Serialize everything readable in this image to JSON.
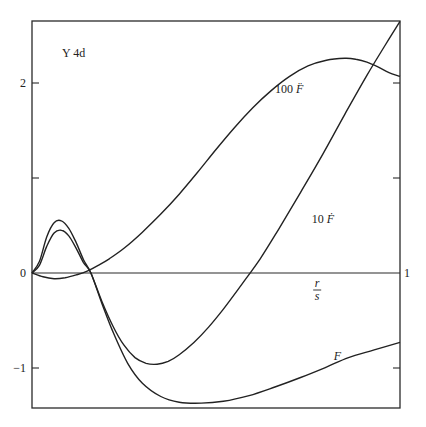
{
  "chart_data": {
    "type": "line",
    "title": "Y 4d",
    "xlabel": "r/s",
    "xlabel_num": "r",
    "xlabel_den": "s",
    "ylabel": "",
    "xlim": [
      0,
      1
    ],
    "ylim": [
      -1.4,
      2.65
    ],
    "x_tick_labels": [
      {
        "value": 1,
        "label": "1"
      }
    ],
    "y_tick_labels": [
      {
        "value": 2,
        "label": "2"
      },
      {
        "value": 0,
        "label": "0"
      },
      {
        "value": -1,
        "label": "-1"
      }
    ],
    "y_ticks_unlabeled": [
      1
    ],
    "right_axis_ticks": [
      2,
      1,
      -1
    ],
    "grid": false,
    "legend": "inline labels",
    "series": [
      {
        "name": "F",
        "label_prefix": "",
        "label_symbol": "F",
        "label_pos": [
          0.82,
          -0.92
        ],
        "x": [
          0,
          0.02,
          0.04,
          0.06,
          0.08,
          0.1,
          0.12,
          0.14,
          0.16,
          0.19,
          0.22,
          0.26,
          0.3,
          0.35,
          0.4,
          0.46,
          0.52,
          0.59,
          0.66,
          0.73,
          0.8,
          0.86,
          0.93,
          1.0
        ],
        "y": [
          0,
          0.08,
          0.28,
          0.42,
          0.45,
          0.39,
          0.26,
          0.11,
          0.0,
          -0.32,
          -0.62,
          -0.95,
          -1.16,
          -1.3,
          -1.36,
          -1.37,
          -1.35,
          -1.29,
          -1.2,
          -1.1,
          -0.99,
          -0.89,
          -0.81,
          -0.73
        ]
      },
      {
        "name": "10 F-dot",
        "label_prefix": "10",
        "label_symbol": "Ḟ",
        "label_pos": [
          0.76,
          0.53
        ],
        "x": [
          0,
          0.02,
          0.04,
          0.06,
          0.08,
          0.1,
          0.12,
          0.14,
          0.16,
          0.19,
          0.22,
          0.25,
          0.28,
          0.31,
          0.34,
          0.37,
          0.4,
          0.44,
          0.48,
          0.52,
          0.57,
          0.62,
          0.67,
          0.73,
          0.79,
          0.85,
          0.91,
          0.96,
          1.0
        ],
        "y": [
          0,
          0.12,
          0.38,
          0.53,
          0.55,
          0.47,
          0.32,
          0.14,
          0.0,
          -0.3,
          -0.56,
          -0.76,
          -0.89,
          -0.95,
          -0.96,
          -0.93,
          -0.86,
          -0.73,
          -0.57,
          -0.38,
          -0.12,
          0.15,
          0.46,
          0.85,
          1.25,
          1.67,
          2.08,
          2.4,
          2.65
        ]
      },
      {
        "name": "100 F-double-dot",
        "label_prefix": "100",
        "label_symbol": "F̈",
        "label_pos": [
          0.66,
          1.9
        ],
        "x": [
          0,
          0.03,
          0.06,
          0.09,
          0.12,
          0.15,
          0.18,
          0.21,
          0.25,
          0.3,
          0.35,
          0.4,
          0.45,
          0.5,
          0.55,
          0.6,
          0.65,
          0.7,
          0.75,
          0.8,
          0.85,
          0.88,
          0.91,
          0.94,
          0.97,
          1.0
        ],
        "y": [
          0,
          -0.04,
          -0.06,
          -0.05,
          -0.02,
          0.02,
          0.08,
          0.15,
          0.26,
          0.43,
          0.62,
          0.83,
          1.06,
          1.3,
          1.53,
          1.74,
          1.92,
          2.07,
          2.18,
          2.24,
          2.26,
          2.25,
          2.22,
          2.17,
          2.11,
          2.07
        ]
      }
    ]
  },
  "plot_area_px": {
    "left": 32,
    "right": 400,
    "top": 21,
    "bottom": 408,
    "zero_y": 273,
    "px_per_unit_y": 95
  }
}
